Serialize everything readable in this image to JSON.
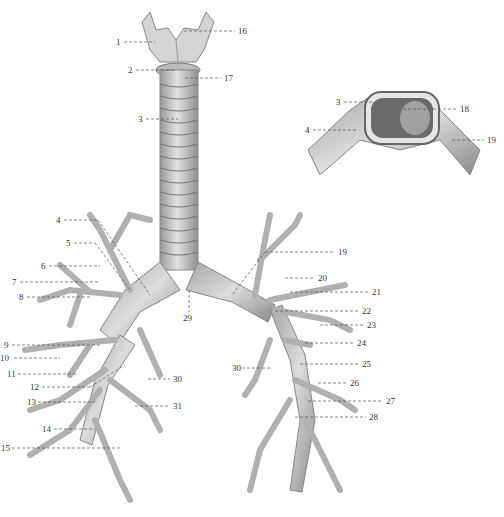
{
  "figure": {
    "colors": {
      "tissue": "#d6d6d6",
      "shade": "#9a9a9a",
      "dark": "#555555",
      "label": "#333333",
      "leader": "#555555"
    },
    "labels": [
      {
        "n": "1",
        "x": 116,
        "y": 37,
        "side": "left"
      },
      {
        "n": "2",
        "x": 128,
        "y": 66,
        "side": "left"
      },
      {
        "n": "3",
        "x": 138,
        "y": 115,
        "side": "left"
      },
      {
        "n": "16",
        "x": 238,
        "y": 27,
        "side": "right"
      },
      {
        "n": "17",
        "x": 224,
        "y": 74,
        "side": "right"
      },
      {
        "n": "3",
        "x": 336,
        "y": 97,
        "side": "left"
      },
      {
        "n": "18",
        "x": 460,
        "y": 104,
        "side": "right"
      },
      {
        "n": "4",
        "x": 305,
        "y": 125,
        "side": "left"
      },
      {
        "n": "19",
        "x": 487,
        "y": 136,
        "side": "right"
      },
      {
        "n": "4",
        "x": 56,
        "y": 215,
        "side": "left"
      },
      {
        "n": "5",
        "x": 66,
        "y": 238,
        "side": "left"
      },
      {
        "n": "6",
        "x": 41,
        "y": 262,
        "side": "left"
      },
      {
        "n": "7",
        "x": 12,
        "y": 278,
        "side": "left"
      },
      {
        "n": "8",
        "x": 19,
        "y": 293,
        "side": "left"
      },
      {
        "n": "29",
        "x": 183,
        "y": 314,
        "side": "below"
      },
      {
        "n": "19",
        "x": 338,
        "y": 247,
        "side": "right"
      },
      {
        "n": "20",
        "x": 318,
        "y": 273,
        "side": "right"
      },
      {
        "n": "21",
        "x": 372,
        "y": 288,
        "side": "right"
      },
      {
        "n": "22",
        "x": 362,
        "y": 307,
        "side": "right"
      },
      {
        "n": "23",
        "x": 367,
        "y": 321,
        "side": "right"
      },
      {
        "n": "24",
        "x": 357,
        "y": 339,
        "side": "right"
      },
      {
        "n": "25",
        "x": 362,
        "y": 360,
        "side": "right"
      },
      {
        "n": "30",
        "x": 232,
        "y": 364,
        "side": "left"
      },
      {
        "n": "26",
        "x": 350,
        "y": 379,
        "side": "right"
      },
      {
        "n": "27",
        "x": 386,
        "y": 397,
        "side": "right"
      },
      {
        "n": "28",
        "x": 369,
        "y": 413,
        "side": "right"
      },
      {
        "n": "9",
        "x": 4,
        "y": 341,
        "side": "left"
      },
      {
        "n": "10",
        "x": 0,
        "y": 354,
        "side": "left"
      },
      {
        "n": "11",
        "x": 7,
        "y": 370,
        "side": "left"
      },
      {
        "n": "12",
        "x": 30,
        "y": 383,
        "side": "left"
      },
      {
        "n": "30",
        "x": 173,
        "y": 375,
        "side": "right"
      },
      {
        "n": "13",
        "x": 27,
        "y": 398,
        "side": "left"
      },
      {
        "n": "31",
        "x": 173,
        "y": 402,
        "side": "right"
      },
      {
        "n": "14",
        "x": 42,
        "y": 425,
        "side": "left"
      },
      {
        "n": "15",
        "x": 1,
        "y": 444,
        "side": "left"
      }
    ]
  }
}
